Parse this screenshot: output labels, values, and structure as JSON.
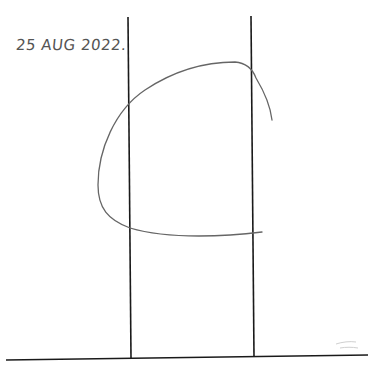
{
  "annotation": {
    "date_text": "25 AUG 2022",
    "dot": "."
  },
  "colors": {
    "background": "#ffffff",
    "lines": "#1a1a1a",
    "curve": "#666666",
    "text": "#555555"
  }
}
